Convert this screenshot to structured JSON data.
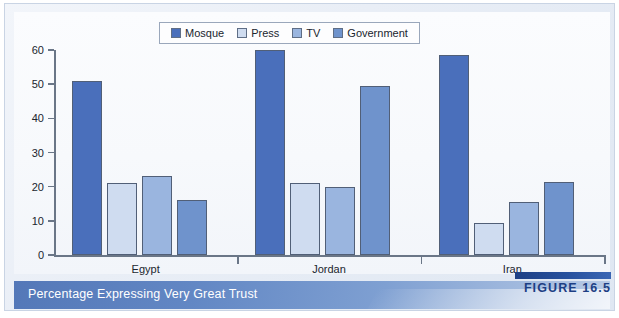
{
  "figure": {
    "caption": "Percentage Expressing Very Great Trust",
    "tag_label": "FIGURE 16.5",
    "source_note": ""
  },
  "colors": {
    "mosque": "#4a6fbb",
    "press": "#cfdcf0",
    "tv": "#9ab5df",
    "government": "#6f93cc",
    "bar_outline": "#515f77",
    "axis": "#6a7687",
    "caption_bar_start": "#5478b8",
    "caption_bar_end": "#b9cbe6",
    "figure_tag": "#1d3f84",
    "panel_background": "#fbfcfe"
  },
  "chart_data": {
    "type": "bar",
    "title": "Percentage Expressing Very Great Trust",
    "xlabel": "",
    "ylabel": "",
    "ylim": [
      0,
      60
    ],
    "yticks": [
      0,
      10,
      20,
      30,
      40,
      50,
      60
    ],
    "ytick_labels": [
      "0",
      "10",
      "20",
      "30",
      "40",
      "50",
      "60"
    ],
    "grid": false,
    "legend_position": "top-center",
    "categories": [
      "Egypt",
      "Jordan",
      "Iran"
    ],
    "series": [
      {
        "name": "Mosque",
        "color": "#4a6fbb",
        "values": [
          51,
          60,
          58.5
        ]
      },
      {
        "name": "Press",
        "color": "#cfdcf0",
        "values": [
          21,
          21,
          9.5
        ]
      },
      {
        "name": "TV",
        "color": "#9ab5df",
        "values": [
          23,
          20,
          15.5
        ]
      },
      {
        "name": "Government",
        "color": "#6f93cc",
        "values": [
          16,
          49.5,
          21.5
        ]
      }
    ]
  }
}
